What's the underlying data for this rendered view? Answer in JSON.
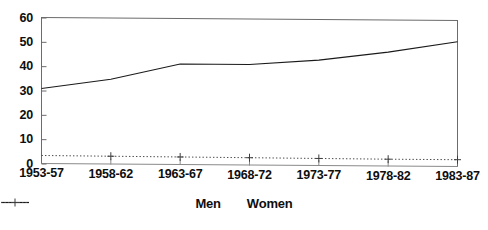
{
  "chart_data": {
    "type": "line",
    "title": "",
    "subtitle": "",
    "xlabel": "",
    "ylabel": "",
    "categories": [
      "1953-57",
      "1958-62",
      "1963-67",
      "1968-72",
      "1973-77",
      "1978-82",
      "1983-87"
    ],
    "series": [
      {
        "name": "Men",
        "values": [
          31,
          35,
          41.5,
          41.5,
          43.5,
          47,
          51.5
        ],
        "style": "solid",
        "marker": "none",
        "color": "#1a1a1a"
      },
      {
        "name": "Women",
        "values": [
          3.5,
          3.4,
          3.3,
          3.2,
          3.1,
          3.0,
          3.0
        ],
        "style": "dotted",
        "marker": "plus",
        "color": "#4a4a4a"
      }
    ],
    "ylim": [
      0,
      60
    ],
    "yticks": [
      0,
      10,
      20,
      30,
      40,
      50,
      60
    ],
    "ytick_labels": [
      "0",
      "10",
      "20",
      "30",
      "40",
      "50",
      "60"
    ],
    "grid": false,
    "legend_position": "bottom-center",
    "frame": "box"
  },
  "legend": {
    "entries": [
      {
        "label": "Men"
      },
      {
        "label": "Women"
      }
    ]
  },
  "colors": {
    "background": "#ffffff",
    "axis": "#4d4d4d",
    "text": "#0e0e0e",
    "men_line": "#1a1a1a",
    "women_line": "#4a4a4a"
  }
}
